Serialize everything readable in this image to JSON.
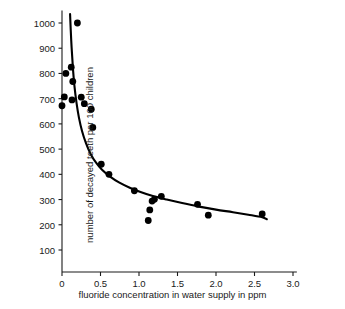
{
  "chart_data": {
    "type": "scatter",
    "title": "",
    "xlabel": "fluoride concentration in water supply in ppm",
    "ylabel": "number of decayed teeth per 100 children",
    "xlim": [
      0,
      3.0
    ],
    "ylim": [
      0,
      1050
    ],
    "grid": false,
    "legend": "none",
    "xticks": [
      0,
      0.5,
      1.0,
      1.5,
      2.0,
      2.5,
      3.0
    ],
    "xtick_labels": [
      "0",
      "0.5",
      "1.0",
      "1.5",
      "2.0",
      "2.5",
      "3.0"
    ],
    "yticks": [
      100,
      200,
      300,
      400,
      500,
      600,
      700,
      800,
      900,
      1000
    ],
    "ytick_labels": [
      "100",
      "200",
      "300",
      "400",
      "500",
      "600",
      "700",
      "800",
      "900",
      "1000"
    ],
    "marker_color": "#000000",
    "marker_size": 3.4,
    "line_color": "#000000",
    "line_width": 2.1,
    "axis_color": "#1a1a1a",
    "points": [
      {
        "x": 0.2,
        "y": 1000
      },
      {
        "x": 0.12,
        "y": 825
      },
      {
        "x": 0.05,
        "y": 800
      },
      {
        "x": 0.14,
        "y": 768
      },
      {
        "x": 0.03,
        "y": 707
      },
      {
        "x": 0.25,
        "y": 706
      },
      {
        "x": 0.13,
        "y": 695
      },
      {
        "x": 0.29,
        "y": 680
      },
      {
        "x": 0.0,
        "y": 672
      },
      {
        "x": 0.38,
        "y": 658
      },
      {
        "x": 0.4,
        "y": 586
      },
      {
        "x": 0.51,
        "y": 440
      },
      {
        "x": 0.61,
        "y": 400
      },
      {
        "x": 0.94,
        "y": 335
      },
      {
        "x": 1.29,
        "y": 313
      },
      {
        "x": 1.2,
        "y": 301
      },
      {
        "x": 1.17,
        "y": 294
      },
      {
        "x": 1.76,
        "y": 281
      },
      {
        "x": 1.14,
        "y": 259
      },
      {
        "x": 2.6,
        "y": 243
      },
      {
        "x": 1.9,
        "y": 238
      },
      {
        "x": 1.12,
        "y": 217
      }
    ],
    "fit_curve": {
      "description": "decreasing hyperbolic trend line",
      "points": [
        {
          "x": 0.105,
          "y": 1035
        },
        {
          "x": 0.12,
          "y": 930
        },
        {
          "x": 0.14,
          "y": 830
        },
        {
          "x": 0.16,
          "y": 755
        },
        {
          "x": 0.19,
          "y": 680
        },
        {
          "x": 0.22,
          "y": 625
        },
        {
          "x": 0.26,
          "y": 572
        },
        {
          "x": 0.31,
          "y": 525
        },
        {
          "x": 0.37,
          "y": 482
        },
        {
          "x": 0.44,
          "y": 447
        },
        {
          "x": 0.52,
          "y": 418
        },
        {
          "x": 0.62,
          "y": 392
        },
        {
          "x": 0.74,
          "y": 368
        },
        {
          "x": 0.88,
          "y": 347
        },
        {
          "x": 1.02,
          "y": 330
        },
        {
          "x": 1.18,
          "y": 314
        },
        {
          "x": 1.36,
          "y": 300
        },
        {
          "x": 1.56,
          "y": 286
        },
        {
          "x": 1.78,
          "y": 272
        },
        {
          "x": 2.0,
          "y": 260
        },
        {
          "x": 2.22,
          "y": 250
        },
        {
          "x": 2.42,
          "y": 240
        },
        {
          "x": 2.6,
          "y": 230
        },
        {
          "x": 2.66,
          "y": 222
        }
      ]
    }
  },
  "axes": {
    "origin_px": {
      "x": 62,
      "y": 272
    },
    "x_unit_px": 77.0,
    "y_100_px": 250,
    "y_1000_px": 23
  }
}
